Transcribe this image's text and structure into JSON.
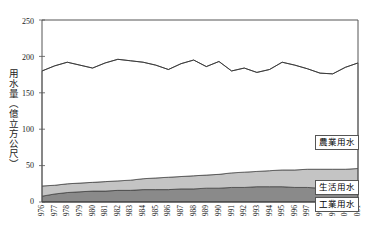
{
  "chart_data": {
    "type": "area",
    "title": "",
    "xlabel": "",
    "ylabel": "用水量（億立方公尺）",
    "ylim": [
      0,
      250
    ],
    "yticks": [
      0,
      50,
      100,
      150,
      200,
      250
    ],
    "grid": false,
    "legend_position": "inside-right",
    "stacked": true,
    "categories": [
      "1976",
      "1977",
      "1978",
      "1979",
      "1980",
      "1981",
      "1982",
      "1983",
      "1984",
      "1985",
      "1986",
      "1987",
      "1988",
      "1989",
      "1990",
      "1991",
      "1992",
      "1993",
      "1994",
      "1995",
      "1996",
      "1997",
      "1998",
      "1999",
      "2000",
      "2001"
    ],
    "tick_labels_x": [
      "976",
      "977",
      "978",
      "979",
      "980",
      "981",
      "982",
      "983",
      "984",
      "985",
      "986",
      "987",
      "988",
      "989",
      "990",
      "991",
      "992",
      "993",
      "994",
      "995",
      "996",
      "997",
      "998",
      "999",
      "000",
      "001"
    ],
    "series": [
      {
        "name": "工業用水",
        "order": 1,
        "color": "#8a8a8a",
        "values": [
          8,
          11,
          13,
          14,
          15,
          15,
          16,
          16,
          17,
          17,
          17,
          18,
          18,
          19,
          19,
          20,
          20,
          21,
          21,
          21,
          20,
          20,
          19,
          18,
          17,
          17
        ]
      },
      {
        "name": "生活用水",
        "order": 2,
        "color": "#c4c4c4",
        "values": [
          14,
          12,
          12,
          12,
          12,
          13,
          13,
          14,
          15,
          16,
          17,
          17,
          18,
          18,
          19,
          20,
          21,
          21,
          22,
          23,
          24,
          25,
          26,
          27,
          28,
          29
        ]
      },
      {
        "name": "農業用水",
        "order": 3,
        "color": "#ffffff",
        "values": [
          158,
          164,
          167,
          162,
          157,
          163,
          167,
          164,
          160,
          155,
          148,
          155,
          159,
          149,
          155,
          140,
          143,
          136,
          139,
          148,
          144,
          138,
          132,
          131,
          140,
          145
        ]
      }
    ],
    "total_line": {
      "name": "總用水量",
      "color": "#333333",
      "values": [
        180,
        187,
        192,
        188,
        184,
        191,
        196,
        194,
        192,
        188,
        182,
        190,
        195,
        186,
        193,
        180,
        184,
        178,
        182,
        192,
        188,
        183,
        177,
        176,
        185,
        191
      ]
    }
  },
  "legend": {
    "items": [
      {
        "label": "農業用水"
      },
      {
        "label": "生活用水"
      },
      {
        "label": "工業用水"
      }
    ]
  },
  "axes": {
    "y_title": "用水量（億立方公尺）",
    "y_tick_labels": [
      "250",
      "200",
      "150",
      "100",
      "50",
      "0"
    ]
  }
}
